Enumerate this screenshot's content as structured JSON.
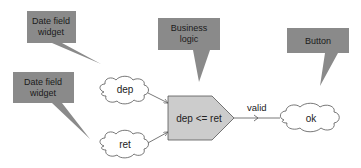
{
  "colors": {
    "callout_fill": "#8a8a8a",
    "callout_text": "#1a1a1a",
    "node_fill": "#cccccc",
    "cloud_fill": "#ffffff",
    "stroke": "#555555"
  },
  "callouts": [
    {
      "id": "date-field-1",
      "lines": [
        "Date field",
        "widget"
      ]
    },
    {
      "id": "date-field-2",
      "lines": [
        "Date field",
        "widget"
      ]
    },
    {
      "id": "business-logic",
      "lines": [
        "Business",
        "logic"
      ]
    },
    {
      "id": "button",
      "lines": [
        "Button"
      ]
    }
  ],
  "nodes": {
    "dep": "dep",
    "ret": "ret",
    "logic": "dep <= ret",
    "ok": "ok"
  },
  "edges": {
    "valid_label": "valid"
  }
}
